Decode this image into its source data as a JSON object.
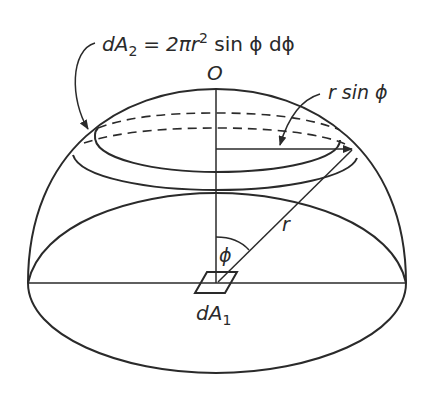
{
  "figure": {
    "type": "hemisphere view-factor diagram",
    "labels": {
      "area_element_formula": {
        "lhs_base": "dA",
        "lhs_sub": "2",
        "equals": "=",
        "rhs_coeff": "2πr",
        "rhs_exp": "2",
        "rhs_rest": " sin ϕ dϕ"
      },
      "center_point": "O",
      "ring_radius": "r sin ϕ",
      "radius": "r",
      "angle": "ϕ",
      "base_element": {
        "base": "dA",
        "sub": "1"
      }
    },
    "colors": {
      "stroke": "#2a2a2a",
      "background": "#ffffff"
    }
  }
}
